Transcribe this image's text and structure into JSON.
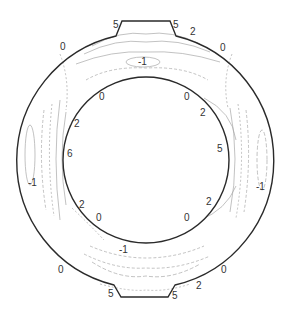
{
  "diagram": {
    "type": "contour-annulus",
    "colors": {
      "boundary": "#2a2a2a",
      "contour": "#9a9a9a",
      "label": "#333333",
      "background": "#ffffff"
    },
    "outer_boundary": {
      "cx": 144,
      "cy": 161,
      "r": 128
    },
    "inner_boundary": {
      "cx": 146,
      "cy": 160,
      "r": 83
    },
    "labels": [
      {
        "id": "top-notch-left",
        "text": "5",
        "x": 113,
        "y": 28
      },
      {
        "id": "top-notch-right",
        "text": "5",
        "x": 173,
        "y": 28
      },
      {
        "id": "top-right-2",
        "text": "2",
        "x": 190,
        "y": 35
      },
      {
        "id": "top-left-0",
        "text": "0",
        "x": 60,
        "y": 50
      },
      {
        "id": "top-right-0",
        "text": "0",
        "x": 220,
        "y": 51
      },
      {
        "id": "top-center-neg1",
        "text": "-1",
        "x": 138,
        "y": 65
      },
      {
        "id": "inner-top-left-0",
        "text": "0",
        "x": 99,
        "y": 100
      },
      {
        "id": "inner-top-right-0",
        "text": "0",
        "x": 184,
        "y": 100
      },
      {
        "id": "inner-left-2",
        "text": "2",
        "x": 74,
        "y": 127
      },
      {
        "id": "inner-right-2",
        "text": "2",
        "x": 200,
        "y": 116
      },
      {
        "id": "inner-left-6",
        "text": "6",
        "x": 67,
        "y": 157
      },
      {
        "id": "inner-right-5",
        "text": "5",
        "x": 217,
        "y": 152
      },
      {
        "id": "outer-left-neg1",
        "text": "-1",
        "x": 28,
        "y": 186
      },
      {
        "id": "outer-right-neg1",
        "text": "-1",
        "x": 256,
        "y": 190
      },
      {
        "id": "inner-bottom-left-2",
        "text": "2",
        "x": 79,
        "y": 208
      },
      {
        "id": "inner-bottom-right-2",
        "text": "2",
        "x": 206,
        "y": 205
      },
      {
        "id": "inner-bottom-left-0",
        "text": "0",
        "x": 96,
        "y": 221
      },
      {
        "id": "inner-bottom-right-0",
        "text": "0",
        "x": 184,
        "y": 221
      },
      {
        "id": "bottom-center-neg1",
        "text": "-1",
        "x": 119,
        "y": 253
      },
      {
        "id": "bottom-left-0",
        "text": "0",
        "x": 58,
        "y": 273
      },
      {
        "id": "bottom-right-0",
        "text": "0",
        "x": 221,
        "y": 273
      },
      {
        "id": "bottom-right-2",
        "text": "2",
        "x": 196,
        "y": 289
      },
      {
        "id": "bottom-notch-left",
        "text": "5",
        "x": 108,
        "y": 297
      },
      {
        "id": "bottom-notch-right",
        "text": "5",
        "x": 172,
        "y": 299
      }
    ]
  }
}
